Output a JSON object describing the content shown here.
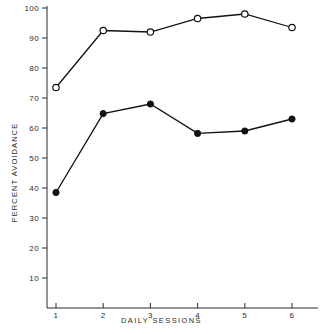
{
  "chart_data": {
    "type": "line",
    "title": "",
    "xlabel": "DAILY SESSIONS",
    "ylabel": "PERCENT AVOIDANCE",
    "x": [
      1,
      2,
      3,
      4,
      5,
      6
    ],
    "xlim": [
      0.65,
      6.45
    ],
    "ylim": [
      0,
      101
    ],
    "grid": false,
    "legend_position": "none",
    "xticks": [
      1,
      2,
      3,
      4,
      5,
      6
    ],
    "xtick_labels": [
      "1",
      "2",
      "3",
      "4",
      "5",
      "6"
    ],
    "yticks": [
      10,
      20,
      30,
      40,
      50,
      60,
      70,
      80,
      90,
      100
    ],
    "ytick_labels": [
      "10",
      "20",
      "30",
      "40",
      "50",
      "60",
      "70",
      "80",
      "90",
      "100"
    ],
    "series": [
      {
        "name": "open-circle-series",
        "marker": "open-circle",
        "color": "#111111",
        "values": [
          73.5,
          92.5,
          92.0,
          96.5,
          98.0,
          93.5
        ]
      },
      {
        "name": "filled-circle-series",
        "marker": "filled-circle",
        "color": "#111111",
        "values": [
          38.5,
          64.8,
          68.0,
          58.2,
          59.0,
          63.0
        ]
      }
    ]
  },
  "colors": {
    "background": "#ffffff",
    "axis": "#2b2b2b",
    "line": "#111111",
    "text": "#2b2b2b"
  }
}
